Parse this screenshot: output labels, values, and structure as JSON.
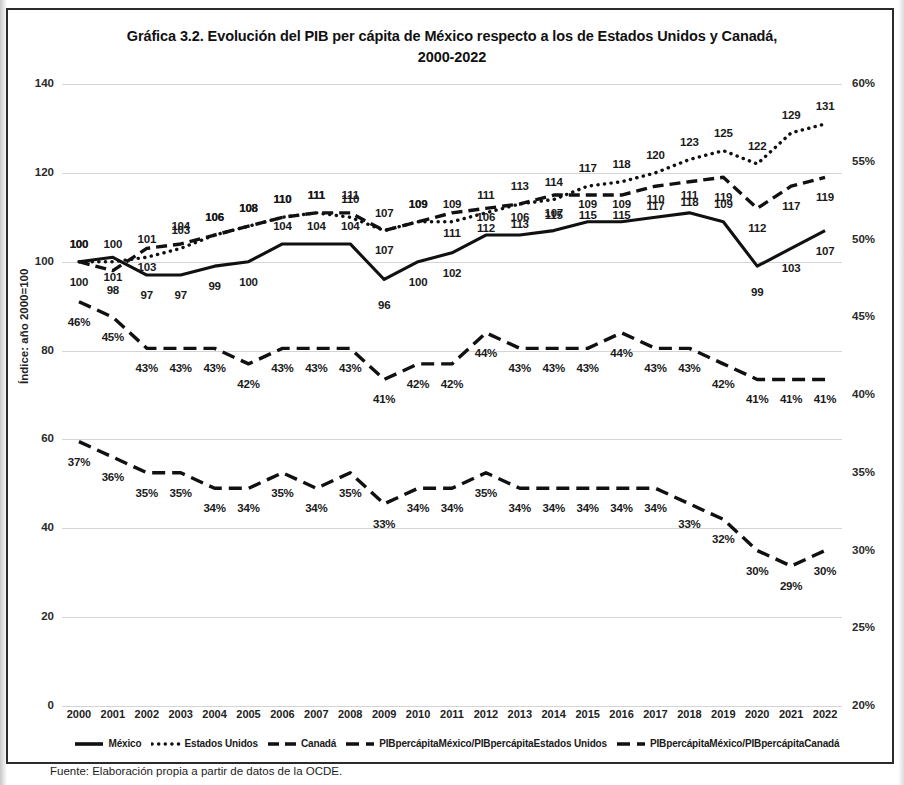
{
  "title": "Gráfica 3.2. Evolución del PIB per cápita de México respecto a los de Estados Unidos y Canadá, 2000-2022",
  "title_line1": "Gráfica 3.2. Evolución del PIB per cápita de México respecto a los de Estados Unidos y Canadá,",
  "title_line2": "2000-2022",
  "source": "Fuente: Elaboración propia a partir de datos de la OCDE.",
  "axes": {
    "left_title": "Índice: año 2000=100",
    "right_title": "Porcentaje",
    "left_ticks": [
      "0",
      "20",
      "40",
      "60",
      "80",
      "100",
      "120",
      "140"
    ],
    "right_ticks": [
      "20%",
      "25%",
      "30%",
      "35%",
      "40%",
      "45%",
      "50%",
      "55%",
      "60%"
    ]
  },
  "legend": {
    "items": [
      {
        "label": "México",
        "style": "solid",
        "key": "legend-key-mexico"
      },
      {
        "label": "Estados Unidos",
        "style": "dotted",
        "key": "legend-key-estados-unidos"
      },
      {
        "label": "Canadá",
        "style": "dashed",
        "key": "legend-key-canada"
      },
      {
        "label": "PIBpercápitaMéxico/PIBpercápitaEstados Unidos",
        "style": "long-dash",
        "key": "legend-key-mx-eeuu"
      },
      {
        "label": "PIBpercápitaMéxico/PIBpercápitaCanadá",
        "style": "dash-dot",
        "key": "legend-key-mx-canada"
      }
    ]
  },
  "chart_data": {
    "type": "line",
    "title": "Gráfica 3.2. Evolución del PIB per cápita de México respecto a los de Estados Unidos y Canadá, 2000-2022",
    "xlabel": "",
    "ylabel": "Índice: año 2000=100",
    "y2label": "Porcentaje",
    "ylim": [
      0,
      140
    ],
    "y2lim": [
      20,
      60
    ],
    "grid": true,
    "legend_position": "bottom",
    "categories": [
      "2000",
      "2001",
      "2002",
      "2003",
      "2004",
      "2005",
      "2006",
      "2007",
      "2008",
      "2009",
      "2010",
      "2011",
      "2012",
      "2013",
      "2014",
      "2015",
      "2016",
      "2017",
      "2018",
      "2019",
      "2020",
      "2021",
      "2022"
    ],
    "series": [
      {
        "name": "México",
        "axis": "left",
        "style": "solid",
        "values": [
          100,
          101,
          97,
          97,
          99,
          100,
          104,
          104,
          104,
          96,
          100,
          102,
          106,
          106,
          107,
          109,
          109,
          110,
          111,
          109,
          99,
          103,
          107
        ],
        "labels": [
          "100",
          "101",
          "97",
          "97",
          "99",
          "100",
          "104",
          "104",
          "104",
          "96",
          "100",
          "102",
          "106",
          "106",
          "107",
          "109",
          "109",
          "110",
          "111",
          "109",
          "99",
          "103",
          "107"
        ]
      },
      {
        "name": "Estados Unidos",
        "axis": "left",
        "style": "dotted",
        "values": [
          100,
          100,
          101,
          103,
          106,
          108,
          110,
          111,
          110,
          107,
          109,
          109,
          111,
          113,
          114,
          117,
          118,
          120,
          123,
          125,
          122,
          129,
          131
        ],
        "labels": [
          "100",
          "100",
          "101",
          "103",
          "106",
          "108",
          "110",
          "111",
          "110",
          "107",
          "109",
          "109",
          "111",
          "113",
          "114",
          "117",
          "118",
          "120",
          "123",
          "125",
          "122",
          "129",
          "131"
        ]
      },
      {
        "name": "Canadá",
        "axis": "left",
        "style": "dashed",
        "values": [
          100,
          98,
          103,
          104,
          106,
          108,
          110,
          111,
          111,
          107,
          109,
          111,
          112,
          113,
          115,
          115,
          115,
          117,
          118,
          119,
          112,
          117,
          119
        ],
        "labels": [
          "100",
          "98",
          "103",
          "104",
          "106",
          "108",
          "110",
          "111",
          "111",
          "107",
          "109",
          "111",
          "112",
          "113",
          "115",
          "115",
          "115",
          "117",
          "118",
          "119",
          "112",
          "117",
          "119"
        ]
      },
      {
        "name": "PIBpercápitaMéxico/PIBpercápitaCanadá",
        "axis": "right",
        "style": "dash-dot",
        "values": [
          46,
          45,
          43,
          43,
          43,
          42,
          43,
          43,
          43,
          41,
          42,
          42,
          44,
          43,
          43,
          43,
          44,
          43,
          43,
          42,
          41,
          41,
          41
        ],
        "labels": [
          "46%",
          "45%",
          "43%",
          "43%",
          "43%",
          "42%",
          "43%",
          "43%",
          "43%",
          "41%",
          "42%",
          "42%",
          "44%",
          "43%",
          "43%",
          "43%",
          "44%",
          "43%",
          "43%",
          "42%",
          "41%",
          "41%",
          "41%"
        ]
      },
      {
        "name": "PIBpercápitaMéxico/PIBpercápitaEstados Unidos",
        "axis": "right",
        "style": "long-dash",
        "values": [
          37,
          36,
          35,
          35,
          34,
          34,
          35,
          34,
          35,
          33,
          34,
          34,
          35,
          34,
          34,
          34,
          34,
          34,
          33,
          32,
          30,
          29,
          30
        ],
        "labels": [
          "37%",
          "36%",
          "35%",
          "35%",
          "34%",
          "34%",
          "35%",
          "34%",
          "35%",
          "33%",
          "34%",
          "34%",
          "35%",
          "34%",
          "34%",
          "34%",
          "34%",
          "34%",
          "33%",
          "32%",
          "30%",
          "29%",
          "30%"
        ]
      }
    ]
  }
}
